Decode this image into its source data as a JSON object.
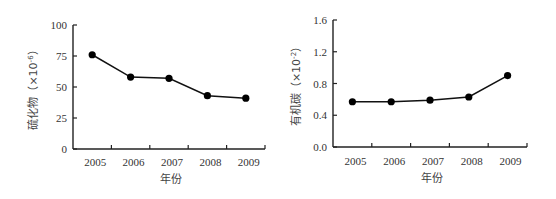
{
  "chart_data": [
    {
      "type": "line",
      "title": "",
      "xlabel": "年份",
      "ylabel": "硫化物（×10⁻⁶）",
      "ylabel_main": "硫化物（×10",
      "ylabel_sup": "-6",
      "ylabel_close": "）",
      "categories": [
        "2005",
        "2006",
        "2007",
        "2008",
        "2009"
      ],
      "series": [
        {
          "name": "硫化物",
          "values": [
            76,
            58,
            57,
            43,
            41
          ]
        }
      ],
      "ylim": [
        0,
        100
      ],
      "yticks": [
        0,
        25,
        50,
        75,
        100
      ],
      "ytick_labels": [
        "0",
        "25",
        "50",
        "75",
        "100"
      ],
      "grid": false,
      "legend": "none"
    },
    {
      "type": "line",
      "title": "",
      "xlabel": "年份",
      "ylabel": "有机碳（×10⁻²）",
      "ylabel_main": "有机碳（×10",
      "ylabel_sup": "-2",
      "ylabel_close": "）",
      "categories": [
        "2005",
        "2006",
        "2007",
        "2008",
        "2009"
      ],
      "series": [
        {
          "name": "有机碳",
          "values": [
            0.57,
            0.57,
            0.59,
            0.63,
            0.9
          ]
        }
      ],
      "ylim": [
        0,
        1.6
      ],
      "yticks": [
        0,
        0.4,
        0.8,
        1.2,
        1.6
      ],
      "ytick_labels": [
        "0.0",
        "0.4",
        "0.8",
        "1.2",
        "1.6"
      ],
      "grid": false,
      "legend": "none"
    }
  ],
  "colors": {
    "line": "#111111",
    "marker": "#000000",
    "axis": "#222222",
    "text": "#333333"
  }
}
